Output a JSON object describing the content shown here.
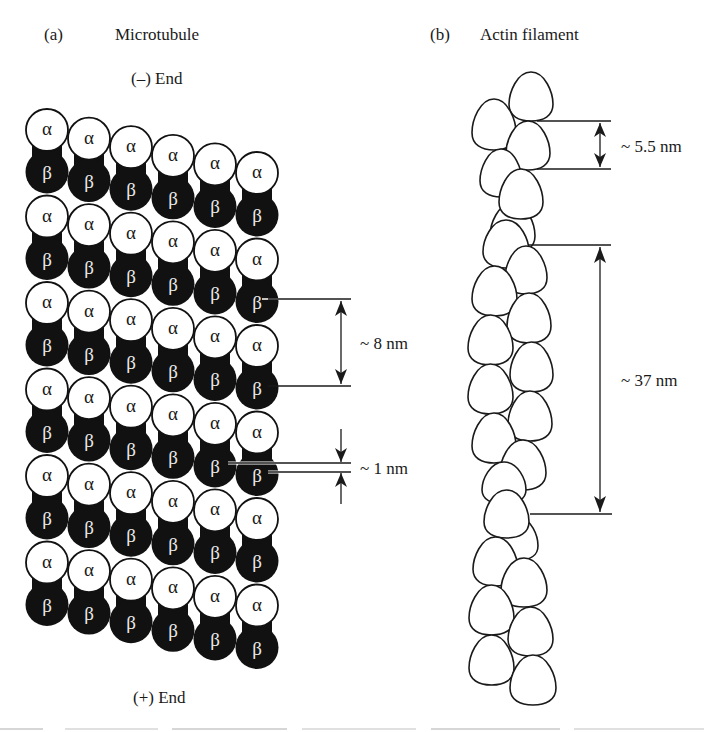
{
  "panel_a": {
    "tag": "(a)",
    "title": "Microtubule",
    "minus_end_label": "(–) End",
    "plus_end_label": "(+) End",
    "subunit_alpha": "α",
    "subunit_beta": "β",
    "rows": 6,
    "columns": 6,
    "colors": {
      "alpha_fill": "#ffffff",
      "beta_fill": "#111111",
      "outline": "#111111",
      "beta_text": "#e8e8e8"
    },
    "measurements": [
      {
        "id": "dimer-spacing",
        "label": "~ 8 nm"
      },
      {
        "id": "stagger",
        "label": "~ 1 nm"
      }
    ]
  },
  "panel_b": {
    "tag": "(b)",
    "title": "Actin filament",
    "colors": {
      "monomer_fill": "#ffffff",
      "outline": "#1a1a1a"
    },
    "measurements": [
      {
        "id": "monomer-rise",
        "label": "~ 5.5 nm"
      },
      {
        "id": "helical-repeat",
        "label": "~ 37 nm"
      }
    ]
  }
}
